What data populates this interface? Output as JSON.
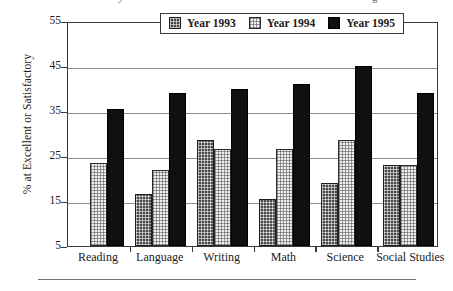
{
  "figure": {
    "top_cut_text": "y",
    "top_cut_text_right": "g"
  },
  "axis": {
    "ylabel": "% at Excellent or Satisfactory",
    "yticks": [
      "55",
      "45",
      "35",
      "25",
      "15",
      "5"
    ]
  },
  "legend": {
    "items": [
      {
        "label": "Year 1993",
        "pattern": "dark-crosshatch",
        "color": "#4a4a4a"
      },
      {
        "label": "Year 1994",
        "pattern": "light-grid",
        "color": "#f0f0f0"
      },
      {
        "label": "Year 1995",
        "pattern": "solid",
        "color": "#101010"
      }
    ]
  },
  "chart_data": {
    "type": "bar",
    "title": "",
    "xlabel": "",
    "ylabel": "% at Excellent or Satisfactory",
    "ylim": [
      5,
      55
    ],
    "ytick_values": [
      5,
      15,
      25,
      35,
      45,
      55
    ],
    "grid": true,
    "legend_position": "top-center",
    "categories": [
      "Reading",
      "Language",
      "Writing",
      "Math",
      "Science",
      "Social Studies"
    ],
    "series": [
      {
        "name": "Year 1993",
        "values": [
          null,
          16.5,
          28.5,
          15.5,
          19,
          23
        ]
      },
      {
        "name": "Year 1994",
        "values": [
          23.5,
          22,
          26.5,
          26.5,
          28.5,
          23
        ]
      },
      {
        "name": "Year 1995",
        "values": [
          35.5,
          39,
          40,
          41,
          45,
          39
        ]
      }
    ]
  }
}
